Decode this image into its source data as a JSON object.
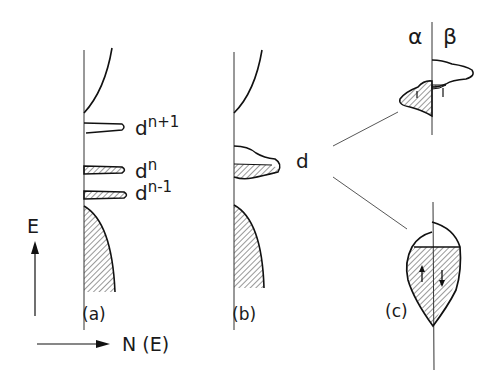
{
  "figure": {
    "panels": [
      {
        "id": "a",
        "label": "(a)",
        "levels": [
          {
            "label": "d",
            "sup": "n+1",
            "filled": false
          },
          {
            "label": "d",
            "sup": "n",
            "filled": true
          },
          {
            "label": "d",
            "sup": "n-1",
            "filled": true
          }
        ]
      },
      {
        "id": "b",
        "label": "(b)",
        "band_label": "d"
      },
      {
        "id": "c",
        "label": "(c)",
        "spin_labels": {
          "left": "α",
          "right": "β"
        }
      }
    ],
    "axes": {
      "y_label": "E",
      "x_label": "N (E)"
    },
    "colors": {
      "ink": "#1a1a1a",
      "hatch": "#333333",
      "background": "#ffffff"
    }
  }
}
